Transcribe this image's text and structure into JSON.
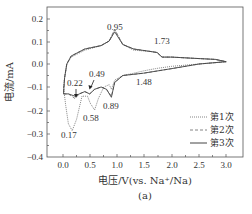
{
  "chart_data": {
    "type": "line",
    "title": "",
    "xlabel": "电压/V(vs. Na⁺/Na)",
    "ylabel": "电流/mA",
    "caption": "(a)",
    "xlim": [
      -0.3,
      3.3
    ],
    "ylim": [
      -0.4,
      0.25
    ],
    "xticks": [
      0.0,
      0.5,
      1.0,
      1.5,
      2.0,
      2.5,
      3.0
    ],
    "xtick_labels": [
      "0.0",
      "0.5",
      "1.0",
      "1.5",
      "2.0",
      "2.5",
      "3.0"
    ],
    "yticks": [
      0.2,
      0.1,
      0.0,
      -0.1,
      -0.2,
      -0.3,
      -0.4
    ],
    "ytick_labels": [
      "0.2",
      "0.1",
      "0.0",
      "−0.1",
      "−0.2",
      "−0.3",
      "−0.4"
    ],
    "grid": false,
    "legend_position": "lower right",
    "series": [
      {
        "name": "第1次",
        "style": "dotted",
        "points": [
          [
            0.01,
            -0.1
          ],
          [
            0.05,
            -0.18
          ],
          [
            0.1,
            -0.26
          ],
          [
            0.17,
            -0.29
          ],
          [
            0.25,
            -0.24
          ],
          [
            0.35,
            -0.14
          ],
          [
            0.45,
            -0.14
          ],
          [
            0.5,
            -0.17
          ],
          [
            0.58,
            -0.2
          ],
          [
            0.65,
            -0.15
          ],
          [
            0.75,
            -0.1
          ],
          [
            0.85,
            -0.09
          ],
          [
            0.89,
            -0.11
          ],
          [
            0.95,
            -0.07
          ],
          [
            1.1,
            -0.05
          ],
          [
            1.3,
            -0.04
          ],
          [
            1.48,
            -0.03
          ],
          [
            1.7,
            -0.02
          ],
          [
            2.0,
            -0.01
          ],
          [
            2.5,
            0.0
          ],
          [
            3.0,
            0.01
          ],
          [
            2.8,
            0.02
          ],
          [
            2.4,
            0.025
          ],
          [
            2.0,
            0.03
          ],
          [
            1.82,
            0.03
          ],
          [
            1.73,
            0.05
          ],
          [
            1.6,
            0.055
          ],
          [
            1.3,
            0.06
          ],
          [
            1.1,
            0.085
          ],
          [
            0.95,
            0.15
          ],
          [
            0.85,
            0.1
          ],
          [
            0.7,
            0.08
          ],
          [
            0.4,
            0.06
          ],
          [
            0.15,
            0.03
          ],
          [
            0.07,
            0.0
          ],
          [
            0.03,
            -0.06
          ],
          [
            0.01,
            -0.1
          ]
        ]
      },
      {
        "name": "第2次",
        "style": "dashed",
        "points": [
          [
            0.01,
            -0.13
          ],
          [
            0.1,
            -0.13
          ],
          [
            0.22,
            -0.15
          ],
          [
            0.3,
            -0.13
          ],
          [
            0.4,
            -0.12
          ],
          [
            0.49,
            -0.13
          ],
          [
            0.58,
            -0.11
          ],
          [
            0.7,
            -0.1
          ],
          [
            0.8,
            -0.11
          ],
          [
            0.89,
            -0.14
          ],
          [
            0.95,
            -0.08
          ],
          [
            1.1,
            -0.05
          ],
          [
            1.48,
            -0.04
          ],
          [
            2.0,
            -0.02
          ],
          [
            2.5,
            0.0
          ],
          [
            3.0,
            0.01
          ],
          [
            2.8,
            0.02
          ],
          [
            2.4,
            0.025
          ],
          [
            2.0,
            0.03
          ],
          [
            1.82,
            0.03
          ],
          [
            1.73,
            0.05
          ],
          [
            1.6,
            0.055
          ],
          [
            1.3,
            0.065
          ],
          [
            1.1,
            0.085
          ],
          [
            0.95,
            0.15
          ],
          [
            0.85,
            0.1
          ],
          [
            0.7,
            0.08
          ],
          [
            0.4,
            0.065
          ],
          [
            0.15,
            0.035
          ],
          [
            0.07,
            0.0
          ],
          [
            0.03,
            -0.06
          ],
          [
            0.01,
            -0.13
          ]
        ]
      },
      {
        "name": "第3次",
        "style": "solid",
        "points": [
          [
            0.01,
            -0.13
          ],
          [
            0.1,
            -0.13
          ],
          [
            0.22,
            -0.14
          ],
          [
            0.3,
            -0.13
          ],
          [
            0.4,
            -0.12
          ],
          [
            0.49,
            -0.13
          ],
          [
            0.58,
            -0.11
          ],
          [
            0.7,
            -0.1
          ],
          [
            0.8,
            -0.11
          ],
          [
            0.89,
            -0.145
          ],
          [
            0.95,
            -0.08
          ],
          [
            1.1,
            -0.05
          ],
          [
            1.48,
            -0.04
          ],
          [
            2.0,
            -0.02
          ],
          [
            2.5,
            0.0
          ],
          [
            3.0,
            0.01
          ],
          [
            2.8,
            0.02
          ],
          [
            2.4,
            0.025
          ],
          [
            2.0,
            0.03
          ],
          [
            1.82,
            0.03
          ],
          [
            1.73,
            0.05
          ],
          [
            1.6,
            0.055
          ],
          [
            1.3,
            0.065
          ],
          [
            1.1,
            0.085
          ],
          [
            0.95,
            0.14
          ],
          [
            0.85,
            0.1
          ],
          [
            0.7,
            0.08
          ],
          [
            0.4,
            0.065
          ],
          [
            0.15,
            0.035
          ],
          [
            0.07,
            0.0
          ],
          [
            0.03,
            -0.06
          ],
          [
            0.01,
            -0.13
          ]
        ]
      }
    ],
    "annotations": [
      {
        "text": "0.95",
        "x": 0.95,
        "y": 0.15
      },
      {
        "text": "1.73",
        "x": 1.73,
        "y": 0.05
      },
      {
        "text": "0.22",
        "x": 0.22,
        "y": -0.14,
        "arrow": true
      },
      {
        "text": "0.49",
        "x": 0.49,
        "y": -0.13,
        "arrow": true
      },
      {
        "text": "1.48",
        "x": 1.48,
        "y": -0.04
      },
      {
        "text": "0.89",
        "x": 0.89,
        "y": -0.145
      },
      {
        "text": "0.58",
        "x": 0.58,
        "y": -0.2
      },
      {
        "text": "0.17",
        "x": 0.17,
        "y": -0.29
      }
    ]
  },
  "labels": {
    "ylabel": "电流/mA",
    "xlabel": "电压/V(vs. Na⁺/Na)",
    "caption": "(a)",
    "legend": [
      "第1次",
      "第2次",
      "第3次"
    ],
    "xticks": [
      "0.0",
      "0.5",
      "1.0",
      "1.5",
      "2.0",
      "2.5",
      "3.0"
    ],
    "yticks": [
      "0.2",
      "0.1",
      "0.0",
      "−0.1",
      "−0.2",
      "−0.3",
      "−0.4"
    ],
    "annotations": [
      "0.95",
      "1.73",
      "0.22",
      "0.49",
      "1.48",
      "0.89",
      "0.58",
      "0.17"
    ]
  }
}
